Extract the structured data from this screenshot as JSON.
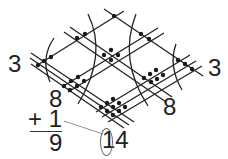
{
  "diagram": {
    "type": "line-crossing multiplication",
    "labels": {
      "left_count": "3",
      "right_count": "3",
      "left_column_top": "8",
      "right_cluster": "8",
      "plus_carry": "+ 1",
      "sum_result": "9",
      "two_digit_total": "14",
      "carried_digit": "1"
    },
    "colors": {
      "line": "#222222",
      "dot": "#1a1a1a",
      "arc": "#222222",
      "arrow": "#777777"
    },
    "line_groups": {
      "slash_direction": [
        1,
        2,
        3
      ],
      "backslash_direction": [
        1,
        2,
        3
      ]
    },
    "intersection_counts": {
      "top": 1,
      "top_left_edge": 2,
      "top_right_edge": 2,
      "left_vertex": 3,
      "center": 4,
      "right_vertex": 3,
      "left_cluster": 6,
      "right_cluster": 6,
      "bottom_cluster": 9
    }
  }
}
